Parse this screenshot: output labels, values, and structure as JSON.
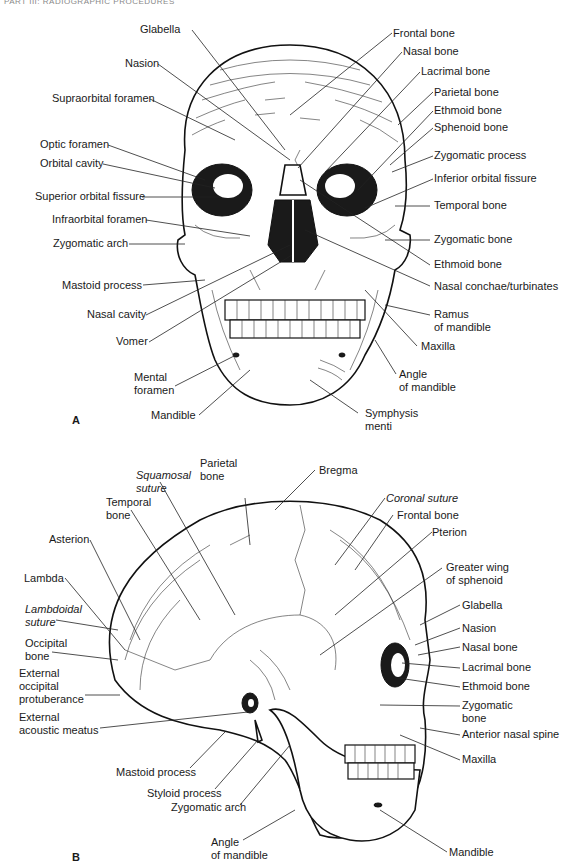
{
  "header": {
    "text": "PART III: RADIOGRAPHIC PROCEDURES"
  },
  "panel_a": {
    "letter": "A",
    "labels_left": [
      "Glabella",
      "Nasion",
      "Supraorbital foramen",
      "Optic foramen",
      "Orbital cavity",
      "Superior orbital fissure",
      "Infraorbital foramen",
      "Zygomatic arch",
      "Mastoid process",
      "Nasal cavity",
      "Vomer",
      "Mental\nforamen",
      "Mandible"
    ],
    "labels_right": [
      "Frontal bone",
      "Nasal bone",
      "Lacrimal bone",
      "Parietal bone",
      "Ethmoid bone",
      "Sphenoid bone",
      "Zygomatic process",
      "Inferior orbital fissure",
      "Temporal bone",
      "Zygomatic bone",
      "Ethmoid bone",
      "Nasal conchae/turbinates",
      "Ramus\nof mandible",
      "Maxilla",
      "Angle\nof mandible",
      "Symphysis\nmenti"
    ]
  },
  "panel_b": {
    "letter": "B",
    "labels_left": [
      "Parietal\nbone",
      "Squamosal\nsuture",
      "Temporal\nbone",
      "Asterion",
      "Lambda",
      "Lambdoidal\nsuture",
      "Occipital\nbone",
      "External\noccipital\nprotuberance",
      "External\nacoustic meatus",
      "Mastoid process",
      "Styloid process",
      "Zygomatic arch",
      "Angle\nof mandible"
    ],
    "labels_right": [
      "Bregma",
      "Coronal suture",
      "Frontal bone",
      "Pterion",
      "Greater wing\nof sphenoid",
      "Glabella",
      "Nasion",
      "Nasal bone",
      "Lacrimal bone",
      "Ethmoid bone",
      "Zygomatic\nbone",
      "Anterior nasal spine",
      "Maxilla",
      "Mandible"
    ],
    "italic_labels": [
      "Squamosal\nsuture",
      "Coronal suture",
      "Lambdoidal\nsuture"
    ]
  }
}
